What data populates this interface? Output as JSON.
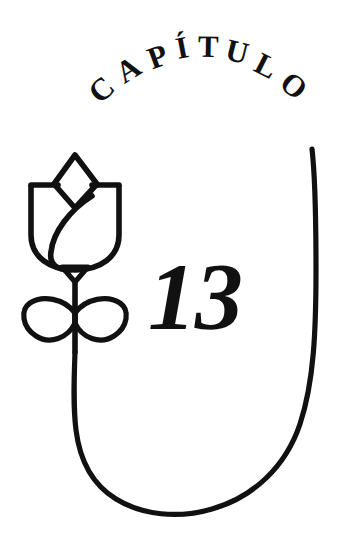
{
  "page": {
    "kind": "book-chapter-opener",
    "background_color": "#ffffff",
    "ink_color": "#111111",
    "width": 348,
    "height": 543
  },
  "heading": {
    "arc_label": "CAPÍTULO",
    "letters": [
      "C",
      "A",
      "P",
      "Í",
      "T",
      "U",
      "L",
      "O"
    ],
    "style": "arched-serif-caps"
  },
  "chapter": {
    "number": "13"
  },
  "ornament": {
    "name": "rose-with-stem-and-leaves",
    "parts": [
      "rose-bud-outer-cup",
      "rose-bud-diamond-top",
      "rose-bud-inner-petal",
      "calyx",
      "stem",
      "leaf-left",
      "leaf-right"
    ]
  },
  "frame": {
    "name": "u-shaped-arc-border",
    "description": "Open curved rule sweeping from upper right down and around to the stem base"
  }
}
